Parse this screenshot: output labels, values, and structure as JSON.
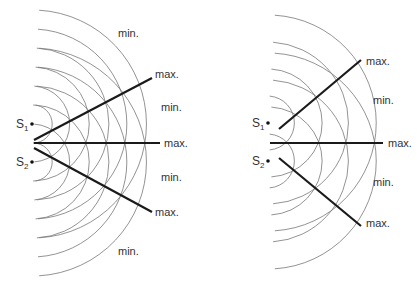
{
  "panels": [
    {
      "id": "left",
      "sources": [
        {
          "label": "S",
          "subscript": "1",
          "x": 32,
          "y": 124
        },
        {
          "label": "S",
          "subscript": "2",
          "x": 32,
          "y": 162
        }
      ],
      "wavelength": 19,
      "arc_count": 6,
      "labels": [
        {
          "text": "min.",
          "x": 118,
          "y": 37
        },
        {
          "text": "max.",
          "x": 155,
          "y": 78
        },
        {
          "text": "min.",
          "x": 161,
          "y": 111
        },
        {
          "text": "max.",
          "x": 164,
          "y": 147
        },
        {
          "text": "min.",
          "x": 161,
          "y": 181
        },
        {
          "text": "max.",
          "x": 155,
          "y": 216
        },
        {
          "text": "min.",
          "x": 118,
          "y": 255
        }
      ]
    },
    {
      "id": "right",
      "sources": [
        {
          "label": "S",
          "subscript": "1",
          "x": 268,
          "y": 123
        },
        {
          "label": "S",
          "subscript": "2",
          "x": 268,
          "y": 161
        }
      ],
      "wavelength": 27,
      "arc_count": 4,
      "labels": [
        {
          "text": "max.",
          "x": 366,
          "y": 65
        },
        {
          "text": "min.",
          "x": 373,
          "y": 104
        },
        {
          "text": "max.",
          "x": 388,
          "y": 147
        },
        {
          "text": "min.",
          "x": 373,
          "y": 186
        },
        {
          "text": "max.",
          "x": 366,
          "y": 227
        }
      ]
    }
  ]
}
